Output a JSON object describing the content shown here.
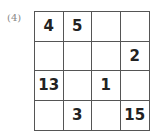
{
  "problem_label": "(4)",
  "grid": {
    "rows": [
      [
        "4",
        "5",
        "",
        ""
      ],
      [
        "",
        "",
        "",
        "2"
      ],
      [
        "13",
        "",
        "1",
        ""
      ],
      [
        "",
        "3",
        "",
        "15"
      ]
    ]
  }
}
